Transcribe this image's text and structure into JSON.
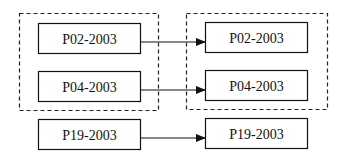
{
  "diagram": {
    "left_group": {
      "dashed": true,
      "nodes": [
        {
          "id": "L1",
          "label": "P02-2003"
        },
        {
          "id": "L2",
          "label": "P04-2003"
        }
      ]
    },
    "right_group": {
      "dashed": true,
      "nodes": [
        {
          "id": "R1",
          "label": "P02-2003"
        },
        {
          "id": "R2",
          "label": "P04-2003"
        }
      ]
    },
    "left_single": {
      "id": "L3",
      "label": "P19-2003"
    },
    "right_single": {
      "id": "R3",
      "label": "P19-2003"
    },
    "edges": [
      {
        "from": "L1",
        "to": "R1"
      },
      {
        "from": "L2",
        "to": "R2"
      },
      {
        "from": "L3",
        "to": "R3"
      }
    ],
    "colors": {
      "stroke": "#111111",
      "background": "#ffffff"
    }
  }
}
